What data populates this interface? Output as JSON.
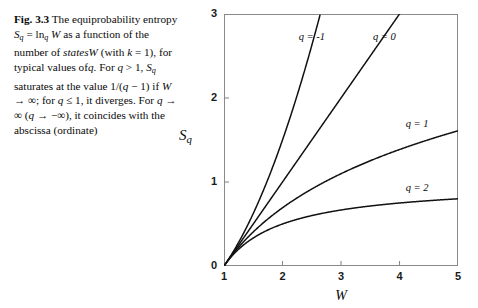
{
  "caption": {
    "figure_label": "Fig. 3.3",
    "text_parts": [
      "The equiprobability entropy ",
      "S",
      "q",
      " = ln",
      "q",
      " W as a function of the number of states W (with k = 1), for typical values of q. For q > 1, S",
      "q",
      " saturates at the value 1/(q − 1) if W → ∞; for q ≤ 1, it diverges. For q → ∞ (q → −∞), it coincides with the abscissa (ordinate)"
    ],
    "full_text": "Fig. 3.3 The equiprobability entropy Sq = lnq W as a function of the number of states W (with k = 1), for typical values of q. For q > 1, Sq saturates at the value 1/(q − 1) if W → ∞; for q ≤ 1, it diverges. For q → ∞ (q → −∞), it coincides with the abscissa (ordinate)",
    "frag": {
      "f1": "The equiprobability",
      "f2": "entropy",
      "f3": "S",
      "f3sub": "q",
      "f4": "= ln",
      "f4sub": "q",
      "f5": "W",
      "f6": "as a",
      "f7": "function of the number of",
      "f8": "states",
      "f9": "W",
      "f10": "(with",
      "f11": "k",
      "f12": "= 1), for",
      "f13": "typical values of",
      "f14": "q",
      "f15": ". For",
      "f16": "q",
      "f17": "> 1,",
      "f18": "S",
      "f18sub": "q",
      "f19": "saturates at the",
      "f20": "value 1/(",
      "f21": "q",
      "f22": "− 1) if",
      "f23": "W",
      "f24": "→ ∞;",
      "f25": "for",
      "f26": "q",
      "f27": "≤ 1, it diverges. For",
      "f28": "q",
      "f29": "→ ∞ (",
      "f30": "q",
      "f31": "→ −∞), it",
      "f32": "coincides with the abscissa",
      "f33": "(ordinate)"
    }
  },
  "chart_data": {
    "type": "line",
    "title": "",
    "xlabel": "W",
    "ylabel": "S",
    "ylabel_sub": "q",
    "xlim": [
      1,
      5
    ],
    "ylim": [
      0,
      3
    ],
    "xticks": [
      1,
      2,
      3,
      4,
      5
    ],
    "xtick_labels": [
      "1",
      "2",
      "3",
      "4",
      "5"
    ],
    "yticks": [
      0,
      1,
      2,
      3
    ],
    "ytick_labels": [
      "0",
      "1",
      "2",
      "3"
    ],
    "grid": false,
    "legend_position": "inline-curve-labels",
    "formula": "S_q = ln_q W = (W^(1-q) - 1)/(1-q)",
    "line_color": "#111111",
    "frame_color": "#8a8a8a",
    "series": [
      {
        "name": "q = -1",
        "q": -1,
        "label": "q = -1",
        "label_x": 2.55,
        "label_y": 2.72,
        "x": [
          1.0,
          1.1,
          1.2,
          1.3,
          1.4,
          1.5,
          1.6,
          1.7,
          1.8,
          1.9,
          2.0,
          2.1,
          2.2,
          2.3,
          2.4,
          2.5
        ],
        "y": [
          0.0,
          0.105,
          0.22,
          0.345,
          0.48,
          0.625,
          0.78,
          0.945,
          1.12,
          1.305,
          1.5,
          1.705,
          1.92,
          2.145,
          2.38,
          2.625
        ]
      },
      {
        "name": "q = 0",
        "q": 0,
        "label": "q = 0",
        "label_x": 3.82,
        "label_y": 2.72,
        "x": [
          1.0,
          1.25,
          1.5,
          1.75,
          2.0,
          2.25,
          2.5,
          2.75,
          3.0,
          3.25,
          3.5,
          3.75,
          4.0
        ],
        "y": [
          0.0,
          0.25,
          0.5,
          0.75,
          1.0,
          1.25,
          1.5,
          1.75,
          2.0,
          2.25,
          2.5,
          2.75,
          3.0
        ]
      },
      {
        "name": "q = 1",
        "q": 1,
        "label": "q = 1",
        "label_x": 4.38,
        "label_y": 1.68,
        "x": [
          1.0,
          1.25,
          1.5,
          1.75,
          2.0,
          2.25,
          2.5,
          2.75,
          3.0,
          3.25,
          3.5,
          3.75,
          4.0,
          4.25,
          4.5,
          4.75,
          5.0
        ],
        "y": [
          0.0,
          0.223,
          0.405,
          0.56,
          0.693,
          0.811,
          0.916,
          1.012,
          1.099,
          1.179,
          1.253,
          1.322,
          1.386,
          1.447,
          1.504,
          1.558,
          1.609
        ]
      },
      {
        "name": "q = 2",
        "q": 2,
        "label": "q = 2",
        "label_x": 4.38,
        "label_y": 0.92,
        "x": [
          1.0,
          1.25,
          1.5,
          1.75,
          2.0,
          2.25,
          2.5,
          2.75,
          3.0,
          3.25,
          3.5,
          3.75,
          4.0,
          4.25,
          4.5,
          4.75,
          5.0
        ],
        "y": [
          0.0,
          0.2,
          0.333,
          0.429,
          0.5,
          0.556,
          0.6,
          0.636,
          0.667,
          0.692,
          0.714,
          0.733,
          0.75,
          0.765,
          0.778,
          0.789,
          0.8
        ]
      }
    ]
  }
}
